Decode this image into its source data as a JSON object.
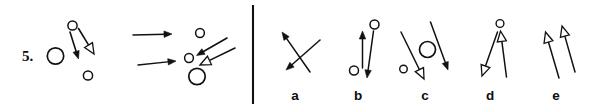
{
  "page": {
    "background_color": "#ffffff",
    "ink_color": "#111111",
    "width": 607,
    "height": 110,
    "kind": "multiple-choice-figure-question"
  },
  "question": {
    "number_label": "5.",
    "number_x": 22,
    "number_y": 61
  },
  "divider": {
    "name": "vertical-divider",
    "x": 253,
    "y1": 5,
    "y2": 104,
    "color": "#111111"
  },
  "prompt": {
    "name": "prompt-sequence",
    "panels": [
      {
        "id": "panel-1",
        "name": "prompt-panel-1",
        "circles": [
          {
            "name": "large-circle",
            "cx": 55.5,
            "cy": 56.0,
            "r": 8.2,
            "stroke_width": 1.7,
            "style": "open"
          },
          {
            "name": "small-circle-top",
            "cx": 72.5,
            "cy": 25.5,
            "r": 4.6,
            "stroke_width": 1.5,
            "style": "open"
          },
          {
            "name": "small-circle-bottom",
            "cx": 88.0,
            "cy": 75.5,
            "r": 4.6,
            "stroke_width": 1.5,
            "style": "open"
          }
        ],
        "arrows": [
          {
            "name": "solid-arrow-down-left",
            "head": "solid",
            "stroke_width": 1.6,
            "x1": 70.0,
            "y1": 32.0,
            "x2": 78.5,
            "y2": 59.0
          },
          {
            "name": "hollow-arrow-down-right",
            "head": "hollow",
            "stroke_width": 1.6,
            "x1": 78.5,
            "y1": 28.5,
            "x2": 94.0,
            "y2": 54.0
          }
        ]
      },
      {
        "id": "panel-2",
        "name": "prompt-transform-arrows",
        "circles": [],
        "arrows": [
          {
            "name": "transform-arrow-upper",
            "head": "solid",
            "stroke_width": 1.5,
            "x1": 133.0,
            "y1": 35.0,
            "x2": 172.0,
            "y2": 34.0
          },
          {
            "name": "transform-arrow-lower",
            "head": "solid",
            "stroke_width": 1.5,
            "x1": 138.0,
            "y1": 65.0,
            "x2": 176.0,
            "y2": 61.0
          }
        ]
      },
      {
        "id": "panel-3",
        "name": "prompt-panel-3",
        "circles": [
          {
            "name": "small-circle-top",
            "cx": 200.0,
            "cy": 33.0,
            "r": 4.4,
            "stroke_width": 1.5,
            "style": "open"
          },
          {
            "name": "small-circle-left",
            "cx": 189.0,
            "cy": 58.0,
            "r": 4.4,
            "stroke_width": 1.5,
            "style": "open"
          },
          {
            "name": "large-circle-bottom",
            "cx": 197.0,
            "cy": 76.5,
            "r": 8.2,
            "stroke_width": 1.7,
            "style": "open"
          }
        ],
        "arrows": [
          {
            "name": "solid-arrow-down-left-upper",
            "head": "solid",
            "stroke_width": 1.6,
            "x1": 227.0,
            "y1": 38.0,
            "x2": 196.5,
            "y2": 55.5
          },
          {
            "name": "hollow-arrow-down-left-lower",
            "head": "hollow",
            "stroke_width": 1.6,
            "x1": 235.0,
            "y1": 48.0,
            "x2": 200.0,
            "y2": 65.0
          }
        ]
      }
    ]
  },
  "options": [
    {
      "id": "a",
      "name": "option-a",
      "label": "a",
      "label_x": 295,
      "label_y": 100,
      "circles": [],
      "arrows": [
        {
          "name": "solid-arrow-up-left",
          "head": "solid",
          "stroke_width": 1.5,
          "x1": 310.0,
          "y1": 72.0,
          "x2": 282.0,
          "y2": 32.0
        },
        {
          "name": "solid-arrow-down-left",
          "head": "solid",
          "stroke_width": 1.5,
          "x1": 320.0,
          "y1": 40.0,
          "x2": 286.0,
          "y2": 70.0
        }
      ]
    },
    {
      "id": "b",
      "name": "option-b",
      "label": "b",
      "label_x": 358,
      "label_y": 100,
      "circles": [
        {
          "name": "small-circle-top-right",
          "cx": 374.5,
          "cy": 24.5,
          "r": 4.5,
          "stroke_width": 1.5,
          "style": "open"
        },
        {
          "name": "small-circle-bottom-left",
          "cx": 354.0,
          "cy": 70.5,
          "r": 4.5,
          "stroke_width": 1.5,
          "style": "open"
        }
      ],
      "arrows": [
        {
          "name": "solid-arrow-up",
          "head": "solid",
          "stroke_width": 1.5,
          "x1": 362.5,
          "y1": 68.0,
          "x2": 362.5,
          "y2": 31.0
        },
        {
          "name": "solid-arrow-down",
          "head": "solid",
          "stroke_width": 1.5,
          "x1": 373.5,
          "y1": 31.0,
          "x2": 367.0,
          "y2": 78.0
        }
      ]
    },
    {
      "id": "c",
      "name": "option-c",
      "label": "c",
      "label_x": 425,
      "label_y": 100,
      "circles": [
        {
          "name": "large-circle-center",
          "cx": 427.5,
          "cy": 49.5,
          "r": 8.0,
          "stroke_width": 1.7,
          "style": "open"
        },
        {
          "name": "small-circle-left",
          "cx": 403.5,
          "cy": 69.0,
          "r": 3.8,
          "stroke_width": 1.4,
          "style": "open"
        }
      ],
      "arrows": [
        {
          "name": "hollow-arrow-down-left",
          "head": "hollow",
          "stroke_width": 1.5,
          "x1": 401.0,
          "y1": 32.0,
          "x2": 424.0,
          "y2": 79.0
        },
        {
          "name": "solid-arrow-down-right",
          "head": "solid",
          "stroke_width": 1.5,
          "x1": 430.5,
          "y1": 22.0,
          "x2": 448.0,
          "y2": 70.0
        }
      ]
    },
    {
      "id": "d",
      "name": "option-d",
      "label": "d",
      "label_x": 490,
      "label_y": 100,
      "circles": [
        {
          "name": "small-circle-top",
          "cx": 500.0,
          "cy": 23.5,
          "r": 3.9,
          "stroke_width": 1.4,
          "style": "open"
        }
      ],
      "arrows": [
        {
          "name": "hollow-arrow-down-left",
          "head": "hollow",
          "stroke_width": 1.5,
          "x1": 497.5,
          "y1": 32.0,
          "x2": 482.0,
          "y2": 76.0
        },
        {
          "name": "hollow-arrow-up",
          "head": "hollow",
          "stroke_width": 1.5,
          "x1": 506.5,
          "y1": 77.0,
          "x2": 500.5,
          "y2": 31.0
        }
      ]
    },
    {
      "id": "e",
      "name": "option-e",
      "label": "e",
      "label_x": 556,
      "label_y": 100,
      "circles": [],
      "arrows": [
        {
          "name": "hollow-arrow-up-left-first",
          "head": "hollow",
          "stroke_width": 1.5,
          "x1": 559.0,
          "y1": 78.0,
          "x2": 545.5,
          "y2": 32.0
        },
        {
          "name": "hollow-arrow-up-left-second",
          "head": "hollow",
          "stroke_width": 1.5,
          "x1": 575.0,
          "y1": 72.0,
          "x2": 562.0,
          "y2": 26.0
        }
      ]
    }
  ]
}
